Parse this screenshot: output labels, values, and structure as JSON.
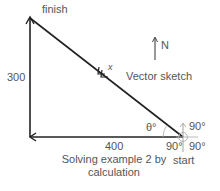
{
  "diagram": {
    "type": "vector-triangle",
    "labels": {
      "finish": "finish",
      "start": "start",
      "vertical_side": "300",
      "horizontal_side": "400",
      "angle": "θ°",
      "resultant": "x",
      "north": "N",
      "vector_sketch": "Vector sketch",
      "caption_line1": "Solving example 2 by",
      "caption_line2": "calculation",
      "compass_angles": [
        "90°",
        "90°",
        "90°"
      ]
    },
    "colors": {
      "line": "#222222",
      "text": "#555555",
      "guide": "#aaaaaa"
    }
  }
}
